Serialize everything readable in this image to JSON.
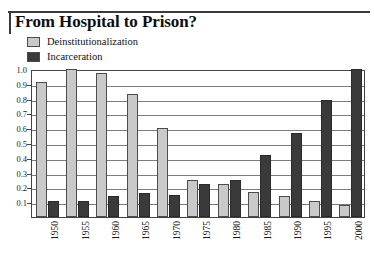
{
  "chart_data": {
    "type": "bar",
    "title": "From Hospital to Prison?",
    "xlabel": "",
    "ylabel": "",
    "ylim": [
      0,
      1.0
    ],
    "yticks": [
      "0.1",
      "0.2",
      "0.3",
      "0.4",
      "0.5",
      "0.6",
      "0.7",
      "0.8",
      "0.9",
      "1.0"
    ],
    "ytick_values": [
      0.1,
      0.2,
      0.3,
      0.4,
      0.5,
      0.6,
      0.7,
      0.8,
      0.9,
      1.0
    ],
    "grid": true,
    "legend_position": "above-plot-left",
    "categories": [
      "1950",
      "1955",
      "1960",
      "1965",
      "1970",
      "1975",
      "1980",
      "1985",
      "1990",
      "1995",
      "2000"
    ],
    "series": [
      {
        "name": "Deinstitutionalization",
        "color": "#c9c9c9",
        "values": [
          0.91,
          1.0,
          0.97,
          0.83,
          0.6,
          0.25,
          0.22,
          0.17,
          0.14,
          0.11,
          0.08
        ]
      },
      {
        "name": "Incarceration",
        "color": "#3a3a3a",
        "values": [
          0.11,
          0.11,
          0.14,
          0.16,
          0.15,
          0.22,
          0.25,
          0.42,
          0.57,
          0.79,
          1.0
        ]
      }
    ]
  },
  "legend": {
    "items": [
      {
        "label": "Deinstitutionalization",
        "color": "#c9c9c9"
      },
      {
        "label": "Incarceration",
        "color": "#3a3a3a"
      }
    ]
  }
}
